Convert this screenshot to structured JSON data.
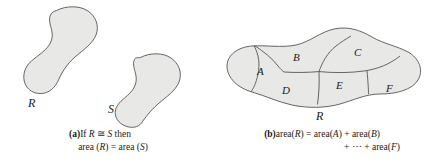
{
  "figure": {
    "background_color": "#ffffff",
    "blob_fill_color": "#e8e8e6",
    "blob_stroke_color": "#555555",
    "divider_stroke_color": "#555555",
    "text_color": "#1a1a1a"
  },
  "panel_a": {
    "shapes": [
      {
        "name": "R",
        "label": "R"
      },
      {
        "name": "S",
        "label": "S"
      }
    ],
    "caption": {
      "tag": "(a)",
      "line_1_prefix": "If ",
      "line_1_r": "R",
      "line_1_relation": " ≅ ",
      "line_1_s": "S",
      "line_1_suffix": " then",
      "line_2_left": "area (",
      "line_2_r": "R",
      "line_2_mid": ") = area (",
      "line_2_s": "S",
      "line_2_right": ")"
    }
  },
  "panel_b": {
    "shape_label": "R",
    "regions": [
      {
        "name": "A",
        "label": "A"
      },
      {
        "name": "B",
        "label": "B"
      },
      {
        "name": "C",
        "label": "C"
      },
      {
        "name": "D",
        "label": "D"
      },
      {
        "name": "E",
        "label": "E"
      },
      {
        "name": "F",
        "label": "F"
      }
    ],
    "caption": {
      "tag": "(b)",
      "line_1_a": "area(",
      "line_1_r": "R",
      "line_1_b": ") = area(",
      "line_1_ra": "A",
      "line_1_c": ") + area(",
      "line_1_rb": "B",
      "line_1_d": ")",
      "line_2_a": "+ ⋯ + area(",
      "line_2_f": "F",
      "line_2_b": ")"
    }
  }
}
